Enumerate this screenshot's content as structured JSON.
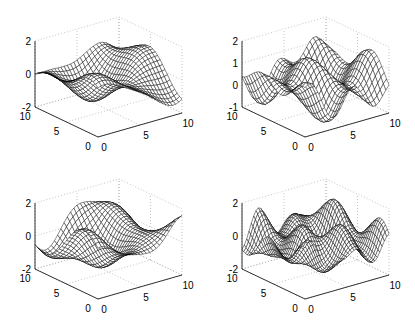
{
  "figure": {
    "title": "",
    "layout": "2x2 subplots of 3D mesh surfaces"
  },
  "chart_data": [
    {
      "type": "surface",
      "title": "",
      "position": "top-left",
      "xlabel": "",
      "ylabel": "",
      "zlabel": "",
      "xlim": [
        0,
        10
      ],
      "ylim": [
        0,
        10
      ],
      "zlim": [
        -2,
        2
      ],
      "xticks": [
        0,
        5,
        10
      ],
      "yticks": [
        0,
        5,
        10
      ],
      "zticks": [
        -2,
        0,
        2
      ],
      "xtick_labels": [
        "0",
        "5",
        "10"
      ],
      "ytick_labels": [
        "0",
        "5",
        "10"
      ],
      "ztick_labels": [
        "-2",
        "0",
        "2"
      ],
      "grid": true,
      "mesh_style": "diamond-lattice",
      "surface_model": {
        "terms": [
          {
            "amp": 0.8,
            "kx": 0.55,
            "ky": 0.35,
            "phase": 0.3
          },
          {
            "amp": 0.5,
            "kx": -0.3,
            "ky": 0.7,
            "phase": 1.2
          },
          {
            "amp": 0.3,
            "kx": 0.9,
            "ky": -0.2,
            "phase": 2.0
          }
        ]
      }
    },
    {
      "type": "surface",
      "title": "",
      "position": "top-right",
      "xlabel": "",
      "ylabel": "",
      "zlabel": "",
      "xlim": [
        0,
        10
      ],
      "ylim": [
        0,
        10
      ],
      "zlim": [
        -1,
        2
      ],
      "xticks": [
        0,
        5,
        10
      ],
      "yticks": [
        0,
        5,
        10
      ],
      "zticks": [
        -1,
        0,
        1,
        2
      ],
      "xtick_labels": [
        "0",
        "5",
        "10"
      ],
      "ytick_labels": [
        "0",
        "5",
        "10"
      ],
      "ztick_labels": [
        "-1",
        "0",
        "1",
        "2"
      ],
      "grid": true,
      "mesh_style": "diamond-lattice",
      "surface_model": {
        "offset": 0.3,
        "terms": [
          {
            "amp": 0.55,
            "kx": 1.3,
            "ky": 0.2,
            "phase": 0.5
          },
          {
            "amp": 0.45,
            "kx": 0.4,
            "ky": 0.9,
            "phase": 1.7
          },
          {
            "amp": 0.3,
            "kx": -0.8,
            "ky": 0.6,
            "phase": 0.9
          }
        ]
      }
    },
    {
      "type": "surface",
      "title": "",
      "position": "bottom-left",
      "xlabel": "",
      "ylabel": "",
      "zlabel": "",
      "xlim": [
        0,
        10
      ],
      "ylim": [
        0,
        10
      ],
      "zlim": [
        -2,
        2
      ],
      "xticks": [
        0,
        5,
        10
      ],
      "yticks": [
        0,
        5,
        10
      ],
      "zticks": [
        -2,
        0,
        2
      ],
      "xtick_labels": [
        "0",
        "5",
        "10"
      ],
      "ytick_labels": [
        "0",
        "5",
        "10"
      ],
      "ztick_labels": [
        "-2",
        "0",
        "2"
      ],
      "grid": true,
      "mesh_style": "diamond-lattice",
      "surface_model": {
        "terms": [
          {
            "amp": 0.9,
            "kx": 0.7,
            "ky": 0.25,
            "phase": 1.0
          },
          {
            "amp": 0.6,
            "kx": 0.2,
            "ky": 0.6,
            "phase": 0.2
          },
          {
            "amp": 0.3,
            "kx": 1.1,
            "ky": -0.5,
            "phase": 2.4
          }
        ]
      }
    },
    {
      "type": "surface",
      "title": "",
      "position": "bottom-right",
      "xlabel": "",
      "ylabel": "",
      "zlabel": "",
      "xlim": [
        0,
        10
      ],
      "ylim": [
        0,
        10
      ],
      "zlim": [
        -2,
        2
      ],
      "xticks": [
        0,
        5,
        10
      ],
      "yticks": [
        0,
        5,
        10
      ],
      "zticks": [
        -2,
        0,
        2
      ],
      "xtick_labels": [
        "0",
        "5",
        "10"
      ],
      "ytick_labels": [
        "0",
        "5",
        "10"
      ],
      "ztick_labels": [
        "-2",
        "0",
        "2"
      ],
      "grid": true,
      "mesh_style": "dense-hatched",
      "surface_model": {
        "terms": [
          {
            "amp": 0.5,
            "kx": 1.2,
            "ky": 0.5,
            "phase": 0.4
          },
          {
            "amp": 0.45,
            "kx": 0.5,
            "ky": 1.1,
            "phase": 1.5
          },
          {
            "amp": 0.35,
            "kx": -1.4,
            "ky": 0.8,
            "phase": 2.2
          },
          {
            "amp": 0.25,
            "kx": 2.0,
            "ky": 0.3,
            "phase": 0.8
          }
        ]
      }
    }
  ]
}
